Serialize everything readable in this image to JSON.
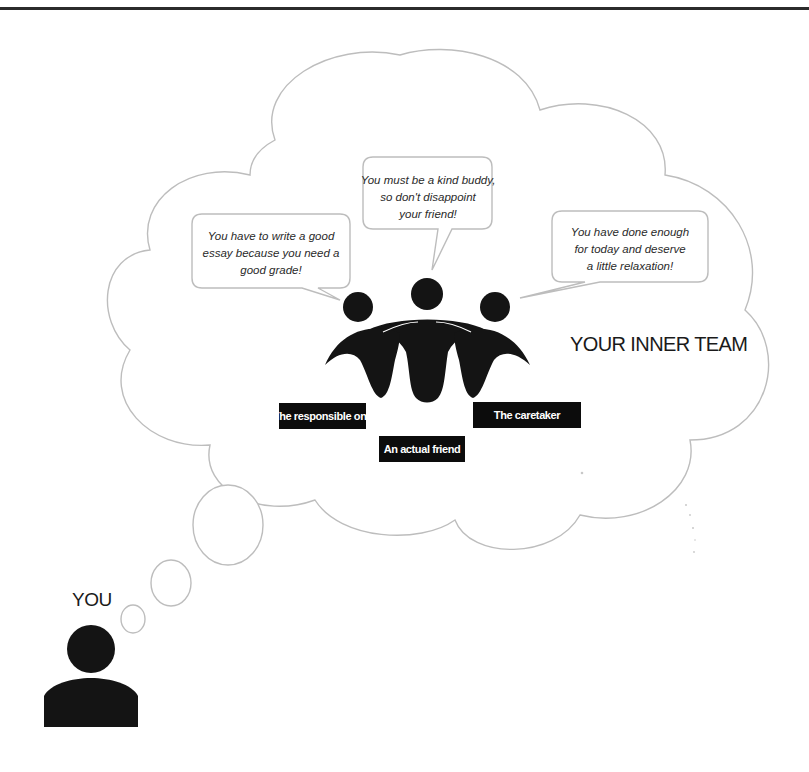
{
  "diagram": {
    "title": "YOUR INNER TEAM",
    "person_label": "YOU",
    "speech_bubbles": [
      {
        "id": "responsible",
        "lines": [
          "You have to write a good",
          "essay because you need a",
          "good grade!"
        ]
      },
      {
        "id": "friend",
        "lines": [
          "You must be a kind buddy,",
          "so don't disappoint",
          "your friend!"
        ]
      },
      {
        "id": "caretaker",
        "lines": [
          "You have done enough",
          "for today and deserve",
          "a little relaxation!"
        ]
      }
    ],
    "team_members": [
      {
        "label": "The responsible one"
      },
      {
        "label": "An actual friend"
      },
      {
        "label": "The caretaker"
      }
    ],
    "colors": {
      "outline": "#bdbdbd",
      "figure": "#141414",
      "label_background": "#0c0c0c",
      "label_text": "#ffffff"
    }
  }
}
